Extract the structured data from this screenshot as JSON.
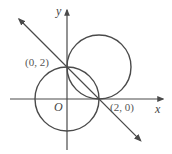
{
  "diagram": {
    "type": "coordinate-plane",
    "axes": {
      "x_label": "x",
      "y_label": "y",
      "origin_label": "O"
    },
    "points": [
      {
        "label": "(0, 2)",
        "x": 0,
        "y": 2
      },
      {
        "label": "(2, 0)",
        "x": 2,
        "y": 0
      }
    ],
    "circles": [
      {
        "name": "circle-centered-origin",
        "center": [
          0,
          0
        ],
        "radius": 2
      },
      {
        "name": "circle-centered-2-2",
        "center": [
          2,
          2
        ],
        "radius": 2
      }
    ],
    "line": {
      "equation": "x + y = 2",
      "through": [
        [
          0,
          2
        ],
        [
          2,
          0
        ]
      ]
    },
    "colors": {
      "stroke": "#4a4a4a",
      "text": "#555555"
    }
  }
}
